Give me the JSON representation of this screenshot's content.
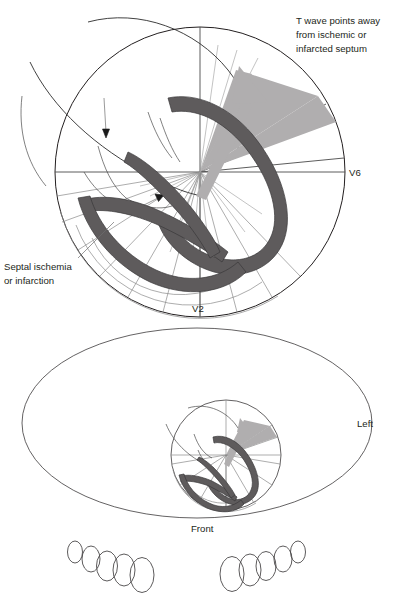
{
  "figure": {
    "colors": {
      "myocardium": "#5e5b5c",
      "vector_wedge": "#b0aeaf",
      "outline": "#231f20",
      "grid": "#8a8a8a",
      "background": "#ffffff"
    }
  },
  "upper_panel": {
    "name": "horizontal-plane-cross-section",
    "annotations": {
      "t_wave": {
        "line1": "T wave points away",
        "line2": "from ischemic or",
        "line3": "infarcted septum"
      },
      "septal": {
        "line1": "Septal ischemia",
        "line2": "or infarction"
      }
    },
    "axis_labels": {
      "right": "V6",
      "bottom": "V2"
    }
  },
  "lower_panel": {
    "name": "torso-orientation-view",
    "labels": {
      "right": "Left",
      "bottom": "Front"
    },
    "ellipse_clusters": {
      "left_count": 5,
      "right_count": 5
    }
  }
}
